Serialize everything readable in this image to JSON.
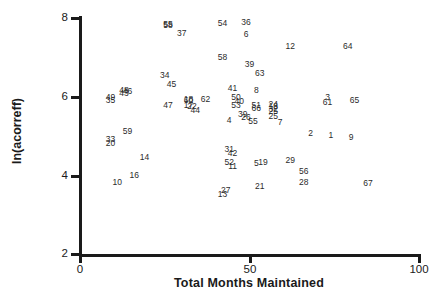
{
  "chart_data": {
    "type": "scatter",
    "title": "",
    "xlabel": "Total Months Maintained",
    "ylabel": "ln(acorreff)",
    "xlim": [
      0,
      100
    ],
    "ylim": [
      2,
      8
    ],
    "xticks": [
      0,
      50,
      100
    ],
    "yticks": [
      2,
      4,
      6,
      8
    ],
    "grid": false,
    "legend": false,
    "marker_style": "numeric-label",
    "points": [
      {
        "label": "55",
        "x": 26,
        "y": 7.85
      },
      {
        "label": "58",
        "x": 26,
        "y": 7.82
      },
      {
        "label": "54",
        "x": 42,
        "y": 7.87
      },
      {
        "label": "36",
        "x": 49,
        "y": 7.9
      },
      {
        "label": "37",
        "x": 30,
        "y": 7.62
      },
      {
        "label": "6",
        "x": 49,
        "y": 7.6
      },
      {
        "label": "12",
        "x": 62,
        "y": 7.3
      },
      {
        "label": "64",
        "x": 79,
        "y": 7.28
      },
      {
        "label": "58",
        "x": 42,
        "y": 7.02
      },
      {
        "label": "39",
        "x": 50,
        "y": 6.83
      },
      {
        "label": "34",
        "x": 25,
        "y": 6.55
      },
      {
        "label": "63",
        "x": 53,
        "y": 6.6
      },
      {
        "label": "45",
        "x": 27,
        "y": 6.33
      },
      {
        "label": "41",
        "x": 45,
        "y": 6.22
      },
      {
        "label": "8",
        "x": 52,
        "y": 6.18
      },
      {
        "label": "48",
        "x": 13,
        "y": 6.18
      },
      {
        "label": "46",
        "x": 14,
        "y": 6.15
      },
      {
        "label": "43",
        "x": 13,
        "y": 6.1
      },
      {
        "label": "49",
        "x": 9,
        "y": 6.0
      },
      {
        "label": "35",
        "x": 9,
        "y": 5.92
      },
      {
        "label": "50",
        "x": 46,
        "y": 6.0
      },
      {
        "label": "3",
        "x": 73,
        "y": 6.0
      },
      {
        "label": "65",
        "x": 81,
        "y": 5.92
      },
      {
        "label": "18",
        "x": 32,
        "y": 5.93
      },
      {
        "label": "60",
        "x": 32,
        "y": 5.92
      },
      {
        "label": "62",
        "x": 37,
        "y": 5.94
      },
      {
        "label": "40",
        "x": 47,
        "y": 5.88
      },
      {
        "label": "61",
        "x": 73,
        "y": 5.86
      },
      {
        "label": "47",
        "x": 26,
        "y": 5.8
      },
      {
        "label": "17",
        "x": 32,
        "y": 5.8
      },
      {
        "label": "22",
        "x": 33,
        "y": 5.76
      },
      {
        "label": "53",
        "x": 46,
        "y": 5.78
      },
      {
        "label": "51",
        "x": 52,
        "y": 5.8
      },
      {
        "label": "66",
        "x": 52,
        "y": 5.72
      },
      {
        "label": "24",
        "x": 57,
        "y": 5.82
      },
      {
        "label": "18",
        "x": 57,
        "y": 5.76
      },
      {
        "label": "32",
        "x": 57,
        "y": 5.7
      },
      {
        "label": "25",
        "x": 57,
        "y": 5.64
      },
      {
        "label": "44",
        "x": 34,
        "y": 5.66
      },
      {
        "label": "39",
        "x": 48,
        "y": 5.55
      },
      {
        "label": "26",
        "x": 49,
        "y": 5.48
      },
      {
        "label": "25",
        "x": 57,
        "y": 5.5
      },
      {
        "label": "4",
        "x": 44,
        "y": 5.4
      },
      {
        "label": "55",
        "x": 51,
        "y": 5.37
      },
      {
        "label": "7",
        "x": 59,
        "y": 5.35
      },
      {
        "label": "59",
        "x": 14,
        "y": 5.12
      },
      {
        "label": "2",
        "x": 68,
        "y": 5.08
      },
      {
        "label": "1",
        "x": 74,
        "y": 5.02
      },
      {
        "label": "9",
        "x": 80,
        "y": 4.98
      },
      {
        "label": "33",
        "x": 9,
        "y": 4.92
      },
      {
        "label": "20",
        "x": 9,
        "y": 4.82
      },
      {
        "label": "31",
        "x": 44,
        "y": 4.68
      },
      {
        "label": "42",
        "x": 45,
        "y": 4.58
      },
      {
        "label": "14",
        "x": 19,
        "y": 4.48
      },
      {
        "label": "52",
        "x": 44,
        "y": 4.35
      },
      {
        "label": "11",
        "x": 45,
        "y": 4.25
      },
      {
        "label": "5",
        "x": 52,
        "y": 4.32
      },
      {
        "label": "19",
        "x": 54,
        "y": 4.35
      },
      {
        "label": "29",
        "x": 62,
        "y": 4.38
      },
      {
        "label": "16",
        "x": 16,
        "y": 4.0
      },
      {
        "label": "56",
        "x": 66,
        "y": 4.1
      },
      {
        "label": "10",
        "x": 11,
        "y": 3.82
      },
      {
        "label": "28",
        "x": 66,
        "y": 3.82
      },
      {
        "label": "67",
        "x": 85,
        "y": 3.8
      },
      {
        "label": "21",
        "x": 53,
        "y": 3.72
      },
      {
        "label": "27",
        "x": 43,
        "y": 3.62
      },
      {
        "label": "13",
        "x": 42,
        "y": 3.52
      }
    ]
  },
  "axes": {
    "x_tick_labels": [
      "0",
      "50",
      "100"
    ],
    "y_tick_labels": [
      "2",
      "4",
      "6",
      "8"
    ],
    "x_title": "Total Months Maintained",
    "y_title": "ln(acorreff)"
  }
}
